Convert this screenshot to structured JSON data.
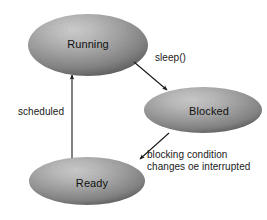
{
  "diagram": {
    "background_color": "#ffffff",
    "states": [
      {
        "id": "running",
        "label": "Running",
        "cx": 88,
        "cy": 45,
        "rx": 60,
        "ry": 31,
        "label_x": 88,
        "label_y": 45
      },
      {
        "id": "blocked",
        "label": "Blocked",
        "cx": 203,
        "cy": 110,
        "rx": 59,
        "ry": 23,
        "label_x": 209,
        "label_y": 112
      },
      {
        "id": "ready",
        "label": "Ready",
        "cx": 87,
        "cy": 181,
        "rx": 58,
        "ry": 24,
        "label_x": 92,
        "label_y": 184
      }
    ],
    "transitions": [
      {
        "id": "running-to-blocked",
        "from": "running",
        "to": "blocked",
        "label": "sleep()",
        "label_lines": [
          "sleep()"
        ],
        "label_x": 155,
        "label_y": 61,
        "x1": 134,
        "y1": 62,
        "x2": 168,
        "y2": 91
      },
      {
        "id": "blocked-to-ready",
        "from": "blocked",
        "to": "ready",
        "label": "blocking condition changes oe interrupted",
        "label_lines": [
          "blocking condition",
          "changes oe interrupted"
        ],
        "label_x": 147,
        "label_y": 158,
        "x1": 168,
        "y1": 133,
        "x2": 139,
        "y2": 160
      },
      {
        "id": "ready-to-running",
        "from": "ready",
        "to": "running",
        "label": "scheduled",
        "label_lines": [
          "scheduled"
        ],
        "label_x": 18,
        "label_y": 115,
        "x1": 72,
        "y1": 158,
        "x2": 72,
        "y2": 74
      }
    ],
    "colors": {
      "ellipse_highlight": "#c2c2c2",
      "ellipse_mid": "#9a9a9a",
      "ellipse_edge": "#5c5c5c",
      "text": "#111111",
      "arrow": "#1a1a1a"
    }
  }
}
